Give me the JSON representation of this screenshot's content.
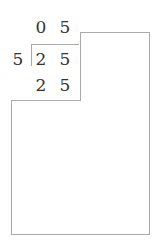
{
  "division": {
    "quotient": [
      "0",
      "5"
    ],
    "divisor": "5",
    "dividend": [
      "2",
      "5"
    ],
    "product": [
      "2",
      "5"
    ]
  },
  "colors": {
    "text": "#333333",
    "lines": "#aaaaaa",
    "background": "#ffffff"
  }
}
